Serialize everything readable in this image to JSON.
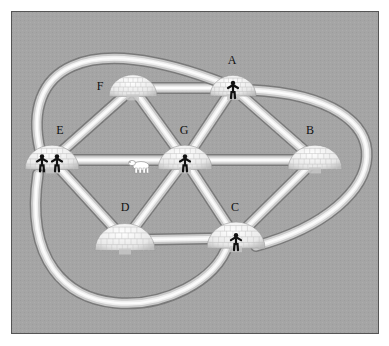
{
  "diagram": {
    "type": "graph",
    "colors": {
      "background": "#a3a3a3",
      "frame_border": "#555555",
      "tunnel_light": "#f2f2f2",
      "tunnel_dark": "#8a8a8a",
      "igloo": "#eeeeee",
      "figure": "#111111"
    },
    "nodes": [
      {
        "id": "A",
        "label": "A",
        "x": 233,
        "y": 88,
        "size": 46,
        "people": 1
      },
      {
        "id": "B",
        "label": "B",
        "x": 315,
        "y": 160,
        "size": 54,
        "people": 0
      },
      {
        "id": "C",
        "label": "C",
        "x": 236,
        "y": 238,
        "size": 58,
        "people": 1
      },
      {
        "id": "D",
        "label": "D",
        "x": 125,
        "y": 240,
        "size": 60,
        "people": 0
      },
      {
        "id": "E",
        "label": "E",
        "x": 52,
        "y": 160,
        "size": 54,
        "people": 2
      },
      {
        "id": "F",
        "label": "F",
        "x": 133,
        "y": 88,
        "size": 48,
        "people": 0
      },
      {
        "id": "G",
        "label": "G",
        "x": 185,
        "y": 160,
        "size": 54,
        "people": 1
      }
    ],
    "label_positions": {
      "A": [
        232,
        64
      ],
      "B": [
        310,
        134
      ],
      "C": [
        235,
        211
      ],
      "D": [
        125,
        211
      ],
      "E": [
        60,
        134
      ],
      "F": [
        100,
        90
      ],
      "G": [
        184,
        134
      ]
    },
    "edges": [
      {
        "from": "F",
        "to": "A",
        "shape": "straight"
      },
      {
        "from": "F",
        "to": "E",
        "shape": "straight"
      },
      {
        "from": "F",
        "to": "G",
        "shape": "straight"
      },
      {
        "from": "A",
        "to": "G",
        "shape": "straight"
      },
      {
        "from": "A",
        "to": "B",
        "shape": "straight"
      },
      {
        "from": "E",
        "to": "G",
        "shape": "straight"
      },
      {
        "from": "G",
        "to": "B",
        "shape": "straight"
      },
      {
        "from": "E",
        "to": "D",
        "shape": "straight"
      },
      {
        "from": "G",
        "to": "D",
        "shape": "straight"
      },
      {
        "from": "G",
        "to": "C",
        "shape": "straight"
      },
      {
        "from": "B",
        "to": "C",
        "shape": "straight"
      },
      {
        "from": "D",
        "to": "C",
        "shape": "straight"
      },
      {
        "from": "E",
        "to": "A",
        "shape": "outer-loop-top"
      },
      {
        "from": "A",
        "to": "C",
        "shape": "outer-loop-right"
      },
      {
        "from": "E",
        "to": "C",
        "shape": "outer-loop-bottom"
      }
    ],
    "extras": [
      {
        "type": "polar-bear",
        "x": 141,
        "y": 166,
        "on_edge": "E-G"
      }
    ]
  }
}
